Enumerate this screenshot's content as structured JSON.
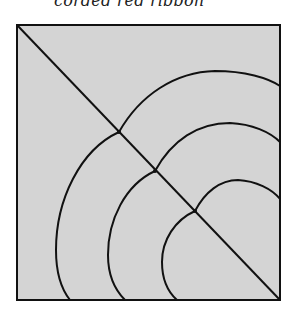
{
  "caption": "corded red ribbon",
  "diagram": {
    "fill_color": "#d4d4d4",
    "stroke_color": "#111111",
    "square": {
      "x1": 17,
      "y1": 25,
      "x2": 280,
      "y2": 300
    },
    "diagonal": {
      "from": [
        17,
        25
      ],
      "to": [
        280,
        300
      ]
    },
    "junctions": [
      [
        119,
        132
      ],
      [
        155,
        171
      ],
      [
        195,
        211
      ]
    ],
    "upper_arc_ends": [
      [
        280,
        86
      ],
      [
        280,
        142
      ],
      [
        280,
        199
      ]
    ],
    "lower_arc_ends": [
      [
        70,
        300
      ],
      [
        125,
        300
      ],
      [
        177,
        300
      ]
    ]
  }
}
